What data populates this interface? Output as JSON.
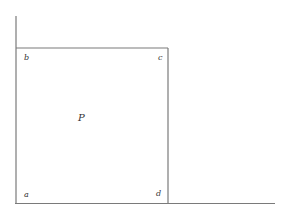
{
  "diagram": {
    "lines": [
      {
        "name": "left-vertical",
        "x1": 16,
        "y1": 16,
        "x2": 16,
        "y2": 203
      },
      {
        "name": "top-edge",
        "x1": 16,
        "y1": 48,
        "x2": 168,
        "y2": 48
      },
      {
        "name": "right-vertical",
        "x1": 168,
        "y1": 48,
        "x2": 168,
        "y2": 203
      },
      {
        "name": "bottom-line",
        "x1": 16,
        "y1": 203,
        "x2": 275,
        "y2": 203
      }
    ],
    "line_color": "#7a7a7a",
    "labels": {
      "a": "a",
      "b": "b",
      "c": "c",
      "d": "d",
      "P": "P"
    }
  }
}
